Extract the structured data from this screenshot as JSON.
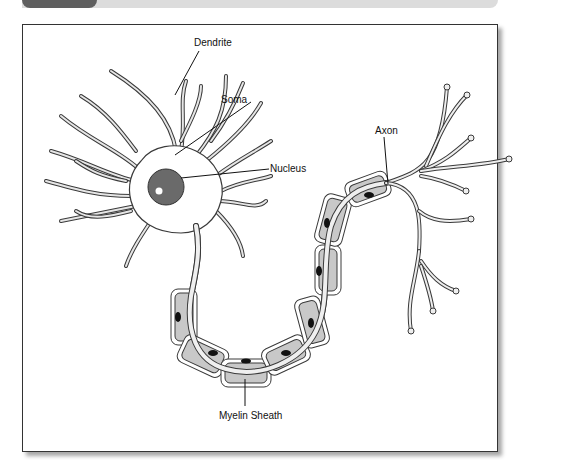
{
  "diagram": {
    "type": "neuron-anatomy",
    "labels": {
      "dendrite": "Dendrite",
      "soma": "Soma",
      "nucleus": "Nucleus",
      "axon": "Axon",
      "myelin_sheath": "Myelin Sheath"
    },
    "colors": {
      "membrane_fill": "#e6e6e6",
      "outline": "#3a3a3a",
      "myelin_fill": "#c8c8c8",
      "nucleus_fill": "#6a6a6a",
      "header_tab": "#5f5f5f",
      "header_bar": "#dcdcdc"
    }
  }
}
